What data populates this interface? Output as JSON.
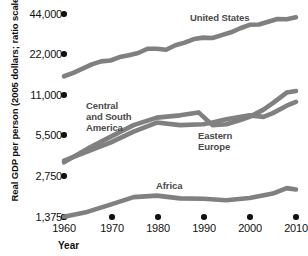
{
  "chart_data": {
    "type": "line",
    "title": "",
    "xlabel": "Year",
    "ylabel": "Real GDP per person (2005 dollars; ratio scale)",
    "scale": "log2",
    "grid": false,
    "legend_position": "inline-annotations",
    "xlim": [
      1960,
      2010
    ],
    "ylim": [
      1375,
      44000
    ],
    "xticks": [
      1960,
      1970,
      1980,
      1990,
      2000,
      2010
    ],
    "xtick_labels": [
      "1960",
      "1970",
      "1980",
      "1990",
      "2000",
      "2010"
    ],
    "yticks": [
      1375,
      2750,
      5500,
      11000,
      22000,
      44000
    ],
    "ytick_labels": [
      "1,375",
      "2,750",
      "5,500",
      "11,000",
      "22,000",
      "44,000"
    ],
    "line_color": "#808080",
    "label_color": "#4a4a4a",
    "axis_color": "#111111",
    "series": [
      {
        "name": "United States",
        "x": [
          1960,
          1962,
          1964,
          1966,
          1968,
          1970,
          1972,
          1974,
          1976,
          1978,
          1980,
          1982,
          1984,
          1986,
          1988,
          1990,
          1992,
          1994,
          1996,
          1998,
          2000,
          2002,
          2004,
          2006,
          2008,
          2010
        ],
        "values": [
          15200,
          16100,
          17300,
          18600,
          19600,
          19900,
          21100,
          21800,
          22600,
          24300,
          24300,
          23900,
          25800,
          27000,
          28700,
          29400,
          29200,
          30700,
          32200,
          34500,
          36600,
          36800,
          38500,
          40400,
          40200,
          41600
        ]
      },
      {
        "name": "Central and South America",
        "x": [
          1960,
          1965,
          1970,
          1975,
          1980,
          1985,
          1990,
          1992,
          1995,
          2000,
          2003,
          2005,
          2008,
          2010
        ],
        "values": [
          3600,
          4200,
          4900,
          5900,
          6900,
          6600,
          6700,
          6900,
          7300,
          7800,
          7600,
          8100,
          9200,
          9800
        ]
      },
      {
        "name": "Eastern Europe",
        "x": [
          1960,
          1965,
          1970,
          1975,
          1980,
          1985,
          1989,
          1992,
          1995,
          1998,
          2000,
          2003,
          2005,
          2008,
          2010
        ],
        "values": [
          3500,
          4400,
          5400,
          6600,
          7500,
          7800,
          8200,
          6600,
          6700,
          7200,
          7600,
          8600,
          9600,
          11500,
          11800
        ]
      },
      {
        "name": "Africa",
        "x": [
          1960,
          1965,
          1970,
          1975,
          1980,
          1985,
          1990,
          1995,
          2000,
          2005,
          2008,
          2010
        ],
        "values": [
          1380,
          1500,
          1700,
          1930,
          1980,
          1890,
          1880,
          1830,
          1900,
          2050,
          2250,
          2200
        ]
      }
    ],
    "annotations": [
      {
        "text": "United States",
        "x": 1990,
        "y": 30000
      },
      {
        "text": "Central and South America",
        "x": 1967,
        "y": 9500
      },
      {
        "text": "Eastern Europe",
        "x": 1996,
        "y": 4600
      },
      {
        "text": "Africa",
        "x": 1983,
        "y": 2500
      }
    ]
  },
  "axis": {
    "y_title": "Real GDP per person (2005 dollars; ratio scale)",
    "x_title": "Year"
  },
  "labels": {
    "united_states": "United States",
    "central_south_america_l1": "Central",
    "central_south_america_l2": "and South",
    "central_south_america_l3": "America",
    "eastern_europe_l1": "Eastern",
    "eastern_europe_l2": "Europe",
    "africa": "Africa"
  },
  "ytick_values": {
    "t0": "44,000",
    "t1": "22,000",
    "t2": "11,000",
    "t3": "5,500",
    "t4": "2,750",
    "t5": "1,375"
  },
  "xtick_values": {
    "t0": "1960",
    "t1": "1970",
    "t2": "1980",
    "t3": "1990",
    "t4": "2000",
    "t5": "2010"
  }
}
